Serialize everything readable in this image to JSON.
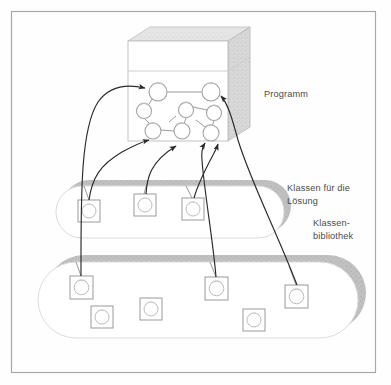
{
  "figure": {
    "border_color": "#a8a8a8",
    "background_color": "#fefefe",
    "labels": {
      "programm": "Programm",
      "klassen_fuer_die_loesung": "Klassen für die\nLösung",
      "klassenbibliothek": "Klassen-\nbibliothek"
    },
    "colors": {
      "line": "#8f8f8f",
      "arrow": "#2a2a2a",
      "shadow_gray": "#b9b9b9",
      "pill_outline": "#d2d2d2",
      "box_face": "#ffffff",
      "box_top": "#ebebeb",
      "box_side": "#dadada",
      "icon_outline": "#9a9a9a",
      "text": "#4b4b4b"
    },
    "program_box": {
      "name": "program-cube",
      "front": {
        "x": 128,
        "y": 41,
        "w": 100,
        "h": 100
      },
      "depth_x": 22,
      "depth_y": -14,
      "divider_y": 71
    },
    "program_nodes": [
      {
        "id": "p1",
        "cx": 158,
        "cy": 92,
        "r": 9
      },
      {
        "id": "p2",
        "cx": 211,
        "cy": 92,
        "r": 9
      },
      {
        "id": "p3",
        "cx": 144,
        "cy": 111,
        "r": 7.5
      },
      {
        "id": "p4",
        "cx": 186,
        "cy": 110,
        "r": 7.5
      },
      {
        "id": "p5",
        "cx": 214,
        "cy": 113,
        "r": 7.5
      },
      {
        "id": "p6",
        "cx": 153,
        "cy": 131,
        "r": 8
      },
      {
        "id": "p7",
        "cx": 182,
        "cy": 131,
        "r": 8
      },
      {
        "id": "p8",
        "cx": 211,
        "cy": 133,
        "r": 8
      }
    ],
    "program_links": [
      {
        "from": "p1",
        "to": "p2"
      },
      {
        "from": "p1",
        "to": "p3"
      },
      {
        "from": "p3",
        "to": "p6"
      },
      {
        "from": "p4",
        "to": "p7"
      },
      {
        "from": "p4",
        "to": "p5"
      },
      {
        "from": "p5",
        "to": "p8"
      },
      {
        "from": "p6",
        "to": "p7"
      },
      {
        "from": "p2",
        "to": "p5"
      }
    ],
    "solution_pill": {
      "name": "solution-classes-pill",
      "x": 56,
      "y": 186,
      "w": 222,
      "h": 52,
      "r": 26,
      "shadow_dx": 7,
      "shadow_dy": -6
    },
    "library_pill": {
      "name": "class-library-pill",
      "x": 38,
      "y": 262,
      "w": 290,
      "h": 76,
      "r": 38,
      "shadow_dx": 8,
      "shadow_dy": -7
    },
    "solution_classes": [
      {
        "id": "s1",
        "x": 78,
        "y": 200,
        "size": 22
      },
      {
        "id": "s2",
        "x": 134,
        "y": 194,
        "size": 22
      },
      {
        "id": "s3",
        "x": 182,
        "y": 198,
        "size": 22
      }
    ],
    "library_classes": [
      {
        "id": "l1",
        "x": 70,
        "y": 276,
        "size": 23
      },
      {
        "id": "l2",
        "x": 91,
        "y": 306,
        "size": 22
      },
      {
        "id": "l3",
        "x": 140,
        "y": 298,
        "size": 22
      },
      {
        "id": "l4",
        "x": 205,
        "y": 277,
        "size": 23
      },
      {
        "id": "l5",
        "x": 243,
        "y": 309,
        "size": 22
      },
      {
        "id": "l6",
        "x": 285,
        "y": 285,
        "size": 23
      }
    ],
    "usage_arrows": [
      {
        "name": "arrow-l1-to-p1",
        "from": "l1",
        "to": "p1"
      },
      {
        "name": "arrow-s1-to-p6",
        "from": "s1",
        "to": "p6"
      },
      {
        "name": "arrow-s2-to-p7",
        "from": "s2",
        "to": "p7"
      },
      {
        "name": "arrow-l4-to-p8",
        "from": "l4",
        "to": "p8"
      },
      {
        "name": "arrow-s3-to-p8",
        "from": "s3",
        "to": "p8"
      },
      {
        "name": "arrow-l6-to-p2",
        "from": "l6",
        "to": "p2"
      }
    ]
  }
}
